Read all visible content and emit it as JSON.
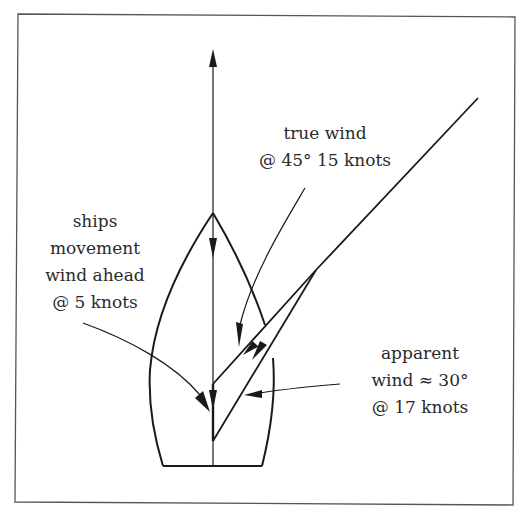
{
  "diagram": {
    "title": "",
    "colors": {
      "line": "#1a1a1a",
      "frame": "#555555",
      "background": "#ffffff",
      "text": "#2a2a2a"
    },
    "labels": {
      "true_wind": {
        "line1": "true wind",
        "line2": "@ 45° 15 knots"
      },
      "ships_movement": {
        "line1": "ships",
        "line2": "movement",
        "line3": "wind ahead",
        "line4": "@ 5 knots"
      },
      "apparent_wind": {
        "line1": "apparent",
        "line2": "wind ≈ 30°",
        "line3": "@ 17 knots"
      }
    },
    "vectors": [
      {
        "name": "ships movement wind",
        "direction": "ahead",
        "speed_knots": 5
      },
      {
        "name": "true wind",
        "angle_deg": 45,
        "speed_knots": 15
      },
      {
        "name": "apparent wind",
        "angle_deg_approx": 30,
        "speed_knots": 17
      }
    ]
  }
}
